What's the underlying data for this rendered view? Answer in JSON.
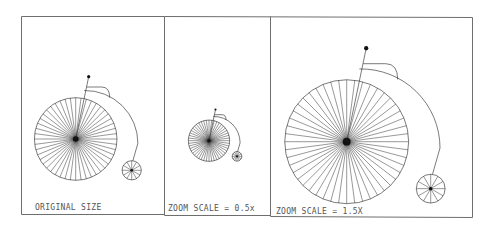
{
  "figure": {
    "panels": [
      {
        "id": "original",
        "caption": "ORIGINAL SIZE",
        "zoom_scale": 1.0
      },
      {
        "id": "half",
        "caption": "ZOOM SCALE = 0.5x",
        "zoom_scale": 0.5
      },
      {
        "id": "one-and-half",
        "caption": "ZOOM SCALE = 1.5X",
        "zoom_scale": 1.5
      }
    ],
    "large_wheel_spokes": 48,
    "small_wheel_spokes": 12,
    "colors": {
      "ink": "#222222",
      "frame": "#6e6e6e",
      "background": "#ffffff"
    }
  }
}
